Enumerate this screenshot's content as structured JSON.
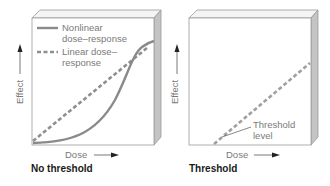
{
  "panels": [
    {
      "id": "no-threshold",
      "title": "No threshold",
      "x_axis_label": "Dose",
      "y_axis_label": "Effect",
      "legend": [
        {
          "style": "solid",
          "label_line1": "Nonlinear",
          "label_line2": "dose–response"
        },
        {
          "style": "dashed",
          "label_line1": "Linear dose–",
          "label_line2": "response"
        }
      ]
    },
    {
      "id": "threshold",
      "title": "Threshold",
      "x_axis_label": "Dose",
      "y_axis_label": "Effect",
      "annotation_line1": "Threshold",
      "annotation_line2": "level"
    }
  ],
  "colors": {
    "curve": "#8a8a8a",
    "dashed": "#9a9a9a",
    "box_edge": "#9b9b9b",
    "box_side": "#c8c8c8",
    "box_top": "#f2f2f2",
    "text": "#7a7a7a",
    "title": "#1a1a1a"
  }
}
